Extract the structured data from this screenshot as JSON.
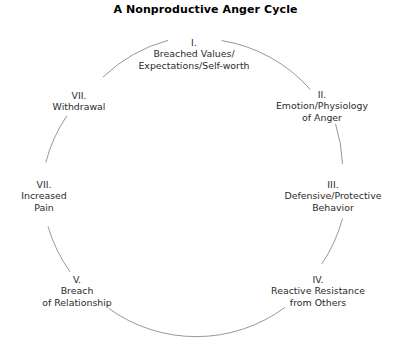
{
  "title": "A Nonproductive Anger Cycle",
  "diagram": {
    "type": "cycle",
    "shape": "circle",
    "line_color": "#8c8c8c",
    "text_color": "#2b2b2b",
    "title_color": "#000000",
    "center": {
      "x": 194,
      "y": 187
    },
    "radius": 149,
    "stages": [
      {
        "numeral": "I.",
        "lines": [
          "Breached Values/",
          "Expectations/Self-worth"
        ],
        "angle_deg": 90,
        "x": 194,
        "y": 54
      },
      {
        "numeral": "II.",
        "lines": [
          "Emotion/Physiology",
          "of Anger"
        ],
        "angle_deg": 38,
        "x": 322,
        "y": 106
      },
      {
        "numeral": "III.",
        "lines": [
          "Defensive/Protective",
          "Behavior"
        ],
        "angle_deg": -8,
        "x": 333,
        "y": 196
      },
      {
        "numeral": "IV.",
        "lines": [
          "Reactive Resistance",
          "from Others"
        ],
        "angle_deg": -52,
        "x": 318,
        "y": 291
      },
      {
        "numeral": "V.",
        "lines": [
          "Breach",
          "of Relationship"
        ],
        "angle_deg": -122,
        "x": 77,
        "y": 291
      },
      {
        "numeral": "VII.",
        "lines": [
          "Increased",
          "Pain"
        ],
        "angle_deg": 186,
        "x": 44,
        "y": 196
      },
      {
        "numeral": "VII.",
        "lines": [
          "Withdrawal"
        ],
        "angle_deg": 140,
        "x": 79,
        "y": 101
      }
    ]
  }
}
